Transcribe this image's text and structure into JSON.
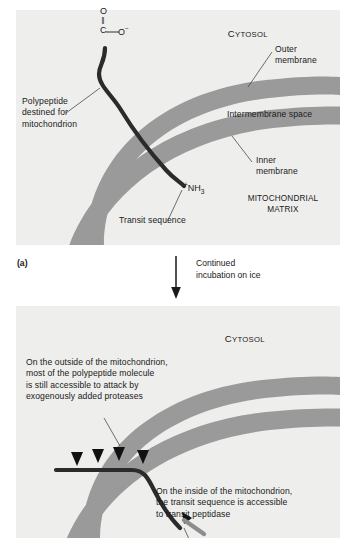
{
  "figure": {
    "panel_label": "(a)",
    "step_caption": "Continued\nincubation on ice"
  },
  "panel_a": {
    "compartments": {
      "cytosol": "Cytosol",
      "cytosol_caps": "CYTOSOL",
      "matrix_line1": "MITOCHONDRIAL",
      "matrix_line2": "MATRIX"
    },
    "membrane_labels": {
      "outer": "Outer\nmembrane",
      "intermembrane": "Intermembrane space",
      "inner": "Inner\nmembrane"
    },
    "molecule_labels": {
      "polypeptide": "Polypeptide\ndestined for\nmitochondrion",
      "transit_sequence": "Transit sequence"
    },
    "chemistry": {
      "carbonyl_oxygen": "O",
      "double_bond": "||",
      "carbon": "C",
      "carboxylate": "O",
      "carboxylate_charge": "−",
      "amino_charge": "+",
      "amino": "NH",
      "amino_count": "3"
    }
  },
  "panel_b": {
    "compartments": {
      "cytosol_caps": "CYTOSOL"
    },
    "annotations": {
      "outside": "On the outside of the mitochondrion,\nmost of the polypeptide molecule\nis still accessible to attack by\nexogenously added proteases",
      "inside": "On the inside of the mitochondrion,\nthe transit sequence is accessible\nto transit peptidase"
    }
  },
  "colors": {
    "panel_background": "#eeeeec",
    "membrane_band": "#9a9a9a",
    "polypeptide": "#2b2b2b",
    "protease_marker": "#111111",
    "peptidase_bar": "#8d8d8d",
    "text": "#1a1a1a",
    "leader_line": "#4a4a4a"
  },
  "icons": {
    "down_arrow": "down-arrow-icon",
    "protease_triangle": "protease-arrowhead-icon",
    "peptidase_bar": "transit-peptidase-icon"
  }
}
